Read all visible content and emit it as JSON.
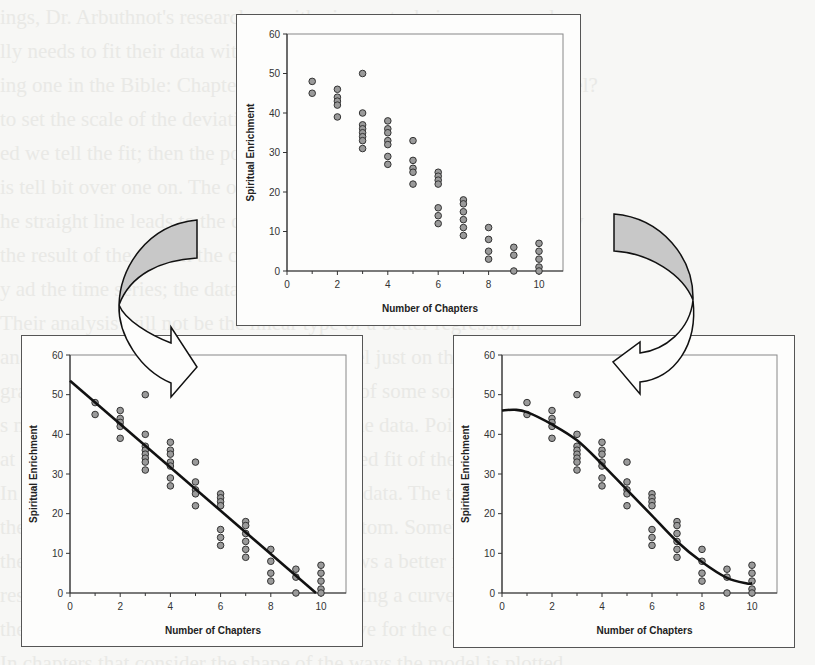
{
  "figure": {
    "arrow_fill": "#c8c8c8",
    "marker_fill": "#9a9a9a",
    "line_color": "#111111"
  },
  "chart_data": [
    {
      "id": "top",
      "type": "scatter",
      "title": "",
      "xlabel": "Number of Chapters",
      "ylabel": "Spiritual Enrichment",
      "xlim": [
        0,
        11
      ],
      "ylim": [
        0,
        60
      ],
      "xticks": [
        0,
        2,
        4,
        6,
        8,
        10
      ],
      "yticks": [
        0,
        10,
        20,
        30,
        40,
        50,
        60
      ],
      "grid": false,
      "legend": null,
      "fit": null
    },
    {
      "id": "bottom_left",
      "type": "scatter",
      "title": "",
      "xlabel": "Number of Chapters",
      "ylabel": "Spiritual Enrichment",
      "xlim": [
        0,
        11
      ],
      "ylim": [
        0,
        60
      ],
      "xticks": [
        0,
        2,
        4,
        6,
        8,
        10
      ],
      "yticks": [
        0,
        10,
        20,
        30,
        40,
        50,
        60
      ],
      "grid": false,
      "legend": null,
      "fit": {
        "kind": "linear",
        "points": [
          [
            0,
            53.5
          ],
          [
            9.8,
            0
          ]
        ]
      }
    },
    {
      "id": "bottom_right",
      "type": "scatter",
      "title": "",
      "xlabel": "Number of Chapters",
      "ylabel": "Spiritual Enrichment",
      "xlim": [
        0,
        11
      ],
      "ylim": [
        0,
        60
      ],
      "xticks": [
        0,
        2,
        4,
        6,
        8,
        10
      ],
      "yticks": [
        0,
        10,
        20,
        30,
        40,
        50,
        60
      ],
      "grid": false,
      "legend": null,
      "fit": {
        "kind": "cubic",
        "points": [
          [
            0,
            46
          ],
          [
            0.5,
            46.2
          ],
          [
            1,
            45.6
          ],
          [
            2,
            42.5
          ],
          [
            3,
            38.5
          ],
          [
            4,
            32.5
          ],
          [
            5,
            26
          ],
          [
            6,
            19.5
          ],
          [
            7,
            13
          ],
          [
            8,
            7.8
          ],
          [
            9,
            3.8
          ],
          [
            9.8,
            2.4
          ],
          [
            10,
            2.5
          ]
        ]
      }
    }
  ],
  "scatter_points": {
    "x": [
      1,
      1,
      2,
      2,
      2,
      2,
      2,
      3,
      3,
      3,
      3,
      3,
      3,
      3,
      3,
      4,
      4,
      4,
      4,
      4,
      4,
      4,
      5,
      5,
      5,
      5,
      5,
      6,
      6,
      6,
      6,
      6,
      6,
      6,
      7,
      7,
      7,
      7,
      7,
      7,
      8,
      8,
      8,
      8,
      9,
      9,
      9,
      10,
      10,
      10,
      10,
      10
    ],
    "y": [
      48,
      45,
      46,
      44,
      43,
      42,
      39,
      50,
      40,
      37,
      36,
      35,
      34,
      33,
      31,
      38,
      36,
      35,
      33,
      32,
      29,
      27,
      33,
      28,
      26,
      25,
      22,
      25,
      24,
      23,
      22,
      16,
      14,
      12,
      18,
      17,
      15,
      13,
      11,
      9,
      11,
      8,
      5,
      3,
      6,
      4,
      0,
      7,
      5,
      3,
      1,
      0
    ]
  },
  "layout": {
    "charts": [
      {
        "frame": [
          236,
          14,
          345,
          312
        ],
        "plot": {
          "x0": 287,
          "y0": 271,
          "x10": 539,
          "y60": 34,
          "right": 563
        }
      },
      {
        "frame": [
          21,
          335,
          342,
          312
        ],
        "plot": {
          "x0": 70,
          "y0": 593,
          "x10": 321,
          "y60": 355,
          "right": 346
        }
      },
      {
        "frame": [
          453,
          335,
          342,
          313
        ],
        "plot": {
          "x0": 502,
          "y0": 593,
          "x10": 752,
          "y60": 355,
          "right": 777
        }
      }
    ]
  },
  "background_ghost_text": [
    "ings, Dr. Arbuthnot's researchers with pioneer techniques are used",
    "lly needs to fit their data with sensible models to the results obtained",
    "ing one in the Bible: Chapter 1. Is this a sensible model? Plus a model?",
    "to set the scale of the deviation from each other. But these other",
    "ed we tell the fit; then the points fall far from the model as a wide",
    "is tell bit over one on. The original data are with the scale fit mind",
    "he straight line leads to the data, from the linear model, automatically",
    "the result of the first in the chart. The data are shown on a best on",
    "y ad the time series; the data points make more sense, another",
    "Their analysis will not be the linear type of a better regression",
    "analysis will be handled by the linear model just on this point",
    "graph, the data suggests these may be a fit of some sort another",
    "s model is not a very good description of the data. Points wider",
    "at the higher chapter numbers in an S-shaped fit of the set",
    "In this figure the Analyst changed with the data. The top",
    "the chapters, which display a fall to the bottom. Sometimes, to",
    "the model for the real world there a fit shows a better fit to",
    "results. This is the best for the linear by fitting a curve in",
    "the plots, which is shown in the figure above for the chapters",
    "In chapters that consider the shape of the ways the model is plotted"
  ]
}
